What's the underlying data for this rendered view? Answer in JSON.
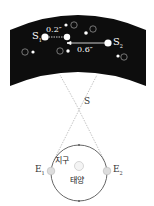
{
  "diagram": {
    "sky": {
      "background_color": "#0d0d0d",
      "star_labels": {
        "s1": "S",
        "s1_sub": "1",
        "s2": "S",
        "s2_sub": "2"
      },
      "angles": {
        "small": "0.2″",
        "large": "0.6″"
      },
      "circled_markers": [
        "㉠",
        "㉡",
        "㉢",
        "㉣",
        "㉤"
      ]
    },
    "star_label": "S",
    "orbit": {
      "earth_label": "지구",
      "sun_label": "태양",
      "e1": "E",
      "e1_sub": "1",
      "e2": "E",
      "e2_sub": "2"
    }
  }
}
